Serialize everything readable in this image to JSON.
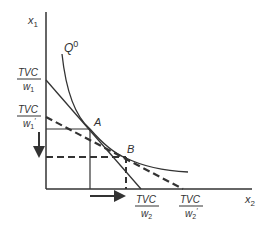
{
  "axes": {
    "y_label": "x",
    "y_sub": "1",
    "x_label": "x",
    "x_sub": "2"
  },
  "curve": {
    "label": "Q",
    "sup": "0"
  },
  "points": {
    "a": "A",
    "b": "B"
  },
  "intercepts": {
    "y1": {
      "num": "TVC",
      "den": "w",
      "den_sub": "1",
      "prime": ""
    },
    "y2": {
      "num": "TVC",
      "den": "w",
      "den_sub": "1",
      "prime": "′"
    },
    "x1": {
      "num": "TVC",
      "den": "w",
      "den_sub": "2",
      "prime": ""
    },
    "x2": {
      "num": "TVC",
      "den": "w",
      "den_sub": "2",
      "prime": "′"
    }
  },
  "colors": {
    "line": "#333333",
    "background": "#ffffff"
  }
}
